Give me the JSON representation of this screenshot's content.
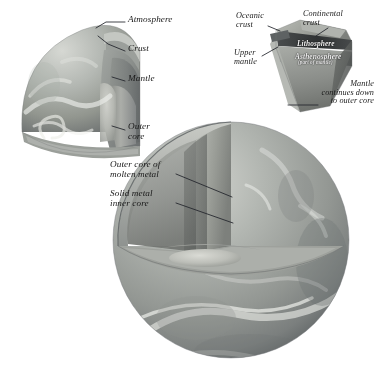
{
  "figure": {
    "background_color": "#ffffff",
    "ink_color": "#1b1b1b",
    "style": "grayscale airbrushed scientific illustration, italic serif labels with leader lines"
  },
  "palette": {
    "paper": "#ffffff",
    "ocean_light": "#b9bcb8",
    "ocean_mid": "#9a9e99",
    "ocean_dark": "#74787a",
    "cloud": "#eceeea",
    "mantle_face": "#8e9290",
    "mantle_face_dark": "#6f7374",
    "crust_band": "#3c3f40",
    "outer_core": "#a7a9a4",
    "inner_core": "#c9cac4",
    "leader_line": "#21242b"
  },
  "detail_sphere": {
    "name": "upper-left cutaway globe",
    "labels": [
      {
        "id": "atmosphere",
        "text": "Atmosphere",
        "x": 128,
        "y": 19,
        "size": "sz-main",
        "align": "left"
      },
      {
        "id": "crust",
        "text": "Crust",
        "x": 128,
        "y": 48,
        "size": "sz-main",
        "align": "left"
      },
      {
        "id": "mantle",
        "text": "Mantle",
        "x": 128,
        "y": 78,
        "size": "sz-main",
        "align": "left"
      },
      {
        "id": "outer-core",
        "text": "Outer\ncore",
        "x": 128,
        "y": 126,
        "size": "sz-main",
        "align": "left"
      }
    ]
  },
  "crust_inset": {
    "name": "top-right crust block diagram",
    "labels": [
      {
        "id": "oceanic-crust",
        "text": "Oceanic\ncrust",
        "x": 236,
        "y": 14,
        "size": "sz-inset",
        "align": "left",
        "tone": "onwhite"
      },
      {
        "id": "continental-crust",
        "text": "Continental\ncrust",
        "x": 303,
        "y": 12,
        "size": "sz-inset",
        "align": "left",
        "tone": "onwhite"
      },
      {
        "id": "lithosphere",
        "text": "Lithosphere",
        "x": 297,
        "y": 43,
        "size": "sz-small",
        "align": "left",
        "tone": "ondark"
      },
      {
        "id": "asthenosphere",
        "text": "Asthenosphere",
        "x": 295,
        "y": 55,
        "size": "sz-small",
        "align": "left",
        "tone": "ondark"
      },
      {
        "id": "asthenosphere-note",
        "text": "(part of mantle)",
        "x": 298,
        "y": 62,
        "size": "sz-tiny",
        "align": "left",
        "tone": "ondark"
      },
      {
        "id": "upper-mantle",
        "text": "Upper\nmantle",
        "x": 234,
        "y": 51,
        "size": "sz-inset",
        "align": "left",
        "tone": "onwhite"
      },
      {
        "id": "mantle-continues",
        "text": "Mantle\ncontinues down\nto outer core",
        "x": 374,
        "y": 83,
        "size": "sz-inset",
        "align": "right",
        "tone": "onwhite"
      }
    ]
  },
  "main_sphere": {
    "name": "large cutaway Earth globe",
    "labels": [
      {
        "id": "outer-core-molten",
        "text": "Outer core of\nmolten metal",
        "x": 110,
        "y": 163,
        "size": "sz-main",
        "align": "left"
      },
      {
        "id": "solid-inner-core",
        "text": "Solid metal\ninner core",
        "x": 110,
        "y": 192,
        "size": "sz-main",
        "align": "left"
      }
    ]
  },
  "leader_lines": [
    {
      "id": "leader-atmosphere",
      "from": [
        126,
        23
      ],
      "to": [
        96,
        23
      ],
      "elbow": [
        110,
        23
      ],
      "target": [
        86,
        30
      ]
    },
    {
      "id": "leader-crust",
      "from": [
        126,
        52
      ],
      "to": [
        97,
        36
      ],
      "target": [
        97,
        36
      ]
    },
    {
      "id": "leader-mantle",
      "from": [
        126,
        82
      ],
      "to": [
        110,
        76
      ],
      "target": [
        110,
        76
      ]
    },
    {
      "id": "leader-outer-core",
      "from": [
        126,
        131
      ],
      "to": [
        110,
        126
      ],
      "target": [
        110,
        126
      ]
    },
    {
      "id": "leader-oceanic-crust",
      "from": [
        268,
        26
      ],
      "to": [
        284,
        33
      ],
      "target": [
        284,
        33
      ]
    },
    {
      "id": "leader-continental-crust",
      "from": [
        325,
        27
      ],
      "to": [
        312,
        38
      ],
      "target": [
        312,
        38
      ]
    },
    {
      "id": "leader-upper-mantle",
      "from": [
        262,
        56
      ],
      "to": [
        277,
        48
      ],
      "target": [
        277,
        48
      ]
    },
    {
      "id": "leader-mantle-continues",
      "from": [
        316,
        105
      ],
      "to": [
        287,
        105
      ],
      "target": [
        287,
        105
      ]
    },
    {
      "id": "leader-outer-core-molten",
      "from": [
        176,
        175
      ],
      "to": [
        231,
        196
      ],
      "target": [
        231,
        196
      ]
    },
    {
      "id": "leader-solid-inner-core",
      "from": [
        176,
        203
      ],
      "to": [
        231,
        222
      ],
      "target": [
        231,
        222
      ]
    }
  ]
}
